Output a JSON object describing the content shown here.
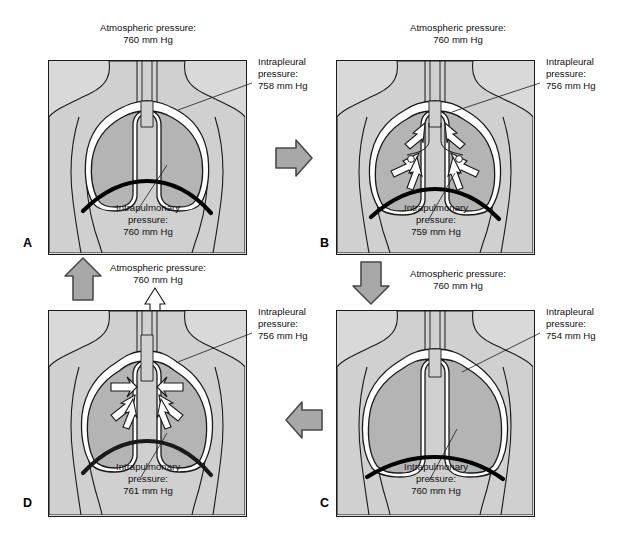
{
  "figure": {
    "units": "mm Hg",
    "colors": {
      "panel_fill": "#d9d9d9",
      "body_fill": "#d0d0d0",
      "lung_fill": "#b4b4b4",
      "pleura_fill": "#ffffff",
      "diaphragm": "#000000",
      "outline": "#1a1a1a",
      "arrow_fill": "#a8a8a8",
      "arrow_stroke": "#4a4a4a",
      "background": "#ffffff"
    }
  },
  "panels": [
    {
      "letter": "A",
      "phase": "at-rest-before-inspiration",
      "atmospheric_label": "Atmospheric pressure:",
      "atmospheric_value": "760 mm Hg",
      "intrapleural_label_line1": "Intrapleural",
      "intrapleural_label_line2": "pressure:",
      "intrapleural_value": "758 mm Hg",
      "intrapulmonary_label_line1": "Intrapulmonary",
      "intrapulmonary_label_line2": "pressure:",
      "intrapulmonary_value": "760 mm Hg",
      "airflow": "none"
    },
    {
      "letter": "B",
      "phase": "inspiration-air-moving-in",
      "atmospheric_label": "Atmospheric pressure:",
      "atmospheric_value": "760 mm Hg",
      "intrapleural_label_line1": "Intrapleural",
      "intrapleural_label_line2": "pressure:",
      "intrapleural_value": "756 mm Hg",
      "intrapulmonary_label_line1": "Intrapulmonary",
      "intrapulmonary_label_line2": "pressure:",
      "intrapulmonary_value": "759 mm Hg",
      "airflow": "inward"
    },
    {
      "letter": "C",
      "phase": "end-of-inspiration",
      "atmospheric_label": "Atmospheric pressure:",
      "atmospheric_value": "760 mm Hg",
      "intrapleural_label_line1": "Intrapleural",
      "intrapleural_label_line2": "pressure:",
      "intrapleural_value": "754 mm Hg",
      "intrapulmonary_label_line1": "Intrapulmonary",
      "intrapulmonary_label_line2": "pressure:",
      "intrapulmonary_value": "760 mm Hg",
      "airflow": "none"
    },
    {
      "letter": "D",
      "phase": "expiration-air-moving-out",
      "atmospheric_label": "Atmospheric pressure:",
      "atmospheric_value": "760 mm Hg",
      "intrapleural_label_line1": "Intrapleural",
      "intrapleural_label_line2": "pressure:",
      "intrapleural_value": "756 mm Hg",
      "intrapulmonary_label_line1": "Intrapulmonary",
      "intrapulmonary_label_line2": "pressure:",
      "intrapulmonary_value": "761 mm Hg",
      "airflow": "outward"
    }
  ],
  "flow_arrows": [
    {
      "name": "arrow-a-to-b",
      "direction": "right"
    },
    {
      "name": "arrow-b-to-c",
      "direction": "down"
    },
    {
      "name": "arrow-c-to-d",
      "direction": "left"
    },
    {
      "name": "arrow-d-to-a",
      "direction": "up"
    }
  ]
}
